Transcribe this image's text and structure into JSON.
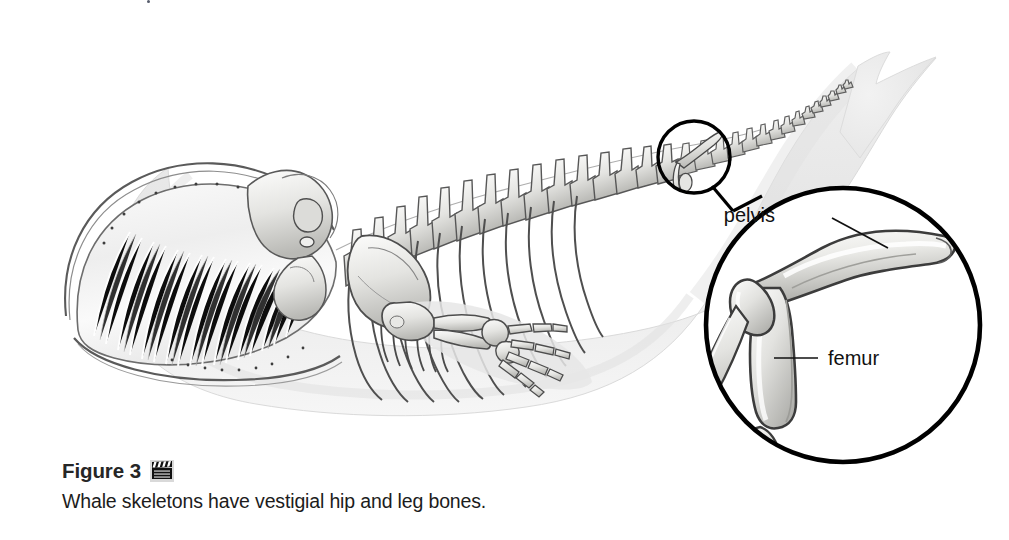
{
  "figure": {
    "label": "Figure 3",
    "icon": "film-clapper-icon",
    "caption": "Whale skeletons have vestigial hip and leg bones."
  },
  "callout": {
    "detail_circle": "magnified-pelvis-femur-detail",
    "source_circle": "highlight-circle-on-whale",
    "labels": [
      {
        "name": "pelvis",
        "text": "pelvis"
      },
      {
        "name": "femur",
        "text": "femur"
      }
    ]
  },
  "colors": {
    "ink": "#111111",
    "outline": "#000000",
    "bone_light": "#f2f2f0",
    "bone_mid": "#c9c9c6",
    "bone_shadow": "#8d8d8a",
    "body_fill": "#ececec",
    "body_edge": "#d3d3d3",
    "page_bg": "#ffffff",
    "label_text": "#1c1c1c"
  }
}
